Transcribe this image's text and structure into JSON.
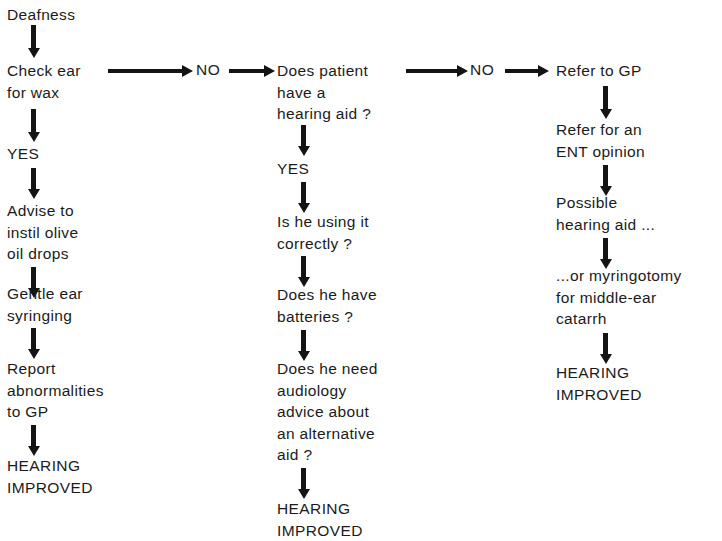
{
  "diagram": {
    "background_color": "#ffffff",
    "ink_color": "#1b1b1b"
  },
  "columns": [
    {
      "id": "column-wax",
      "nodes": [
        {
          "id": "deafness",
          "text": "Deafness"
        },
        {
          "id": "check-ear",
          "text": "Check ear\nfor wax"
        },
        {
          "id": "yes-wax",
          "text": "YES"
        },
        {
          "id": "advise-olive-oil",
          "text": "Advise to\ninstil olive\noil drops"
        },
        {
          "id": "gentle-syringing",
          "text": "Gentle ear\nsyringing"
        },
        {
          "id": "report-abnormal",
          "text": "Report\nabnormalities\nto GP"
        },
        {
          "id": "hearing-improved-1",
          "text": "HEARING\nIMPROVED"
        }
      ]
    },
    {
      "id": "column-hearing-aid",
      "nodes": [
        {
          "id": "has-hearing-aid",
          "text": "Does patient\nhave a\nhearing aid ?"
        },
        {
          "id": "yes-aid",
          "text": "YES"
        },
        {
          "id": "using-correctly",
          "text": "Is he using it\ncorrectly ?"
        },
        {
          "id": "has-batteries",
          "text": "Does he have\nbatteries ?"
        },
        {
          "id": "needs-audiology",
          "text": "Does he need\naudiology\nadvice about\nan alternative\naid ?"
        },
        {
          "id": "hearing-improved-2",
          "text": "HEARING\nIMPROVED"
        }
      ]
    },
    {
      "id": "column-refer",
      "nodes": [
        {
          "id": "refer-gp",
          "text": "Refer to GP"
        },
        {
          "id": "refer-ent",
          "text": "Refer for an\nENT opinion"
        },
        {
          "id": "possible-aid",
          "text": "Possible\nhearing aid ..."
        },
        {
          "id": "myringotomy",
          "text": "...or myringotomy\nfor middle-ear\ncatarrh"
        },
        {
          "id": "hearing-improved-3",
          "text": "HEARING\nIMPROVED"
        }
      ]
    }
  ],
  "branch_labels": {
    "no_1": "NO",
    "no_2": "NO"
  }
}
